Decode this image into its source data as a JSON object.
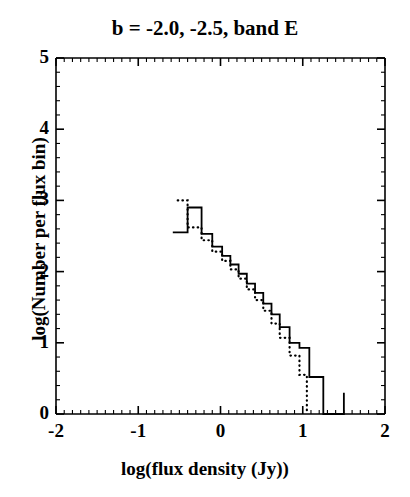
{
  "chart_data": {
    "type": "line",
    "title": "b = -2.0, -2.5, band E",
    "xlabel": "log(flux density (Jy))",
    "ylabel": "log(Number per flux bin)",
    "xlim": [
      -2,
      2
    ],
    "ylim": [
      0,
      5
    ],
    "xticks": [
      -2,
      -1,
      0,
      1,
      2
    ],
    "yticks": [
      0,
      1,
      2,
      3,
      4,
      5
    ],
    "minor_tick_step": 0.1,
    "grid": false,
    "legend": null,
    "axis_color": "#000000",
    "series": [
      {
        "name": "b = -2.0",
        "style": "solid",
        "color": "#000000",
        "drawstyle": "steps-post",
        "bin_edges": [
          -0.58,
          -0.4,
          -0.23,
          -0.1,
          0.02,
          0.12,
          0.22,
          0.32,
          0.42,
          0.52,
          0.62,
          0.72,
          0.84,
          0.96,
          1.08,
          1.25,
          1.5
        ],
        "values": [
          2.55,
          2.9,
          2.53,
          2.35,
          2.22,
          2.1,
          1.97,
          1.83,
          1.7,
          1.55,
          1.4,
          1.22,
          1.0,
          0.93,
          0.52,
          0.0,
          0.3
        ]
      },
      {
        "name": "b = -2.5",
        "style": "dotted",
        "color": "#000000",
        "drawstyle": "steps-post",
        "bin_edges": [
          -0.52,
          -0.4,
          -0.23,
          -0.1,
          0.02,
          0.12,
          0.22,
          0.32,
          0.42,
          0.52,
          0.62,
          0.72,
          0.84,
          0.96,
          1.05
        ],
        "values": [
          3.0,
          2.62,
          2.44,
          2.28,
          2.15,
          2.03,
          1.9,
          1.75,
          1.6,
          1.45,
          1.27,
          1.07,
          0.82,
          0.55,
          0.0
        ]
      }
    ]
  },
  "figure": {
    "background_color": "#ffffff",
    "frame_color": "#000000"
  }
}
